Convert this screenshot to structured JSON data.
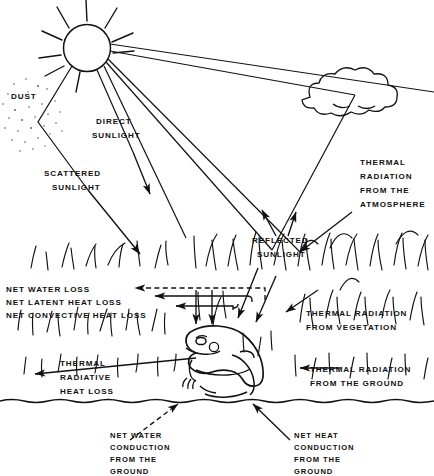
{
  "diagram": {
    "type": "schematic-energy-balance",
    "background_color": "#ffffff",
    "ink_color": "#111111"
  },
  "labels": {
    "dust": "DUST",
    "direct_sunlight": {
      "line1": "DIRECT",
      "line2": "SUNLIGHT"
    },
    "scattered_sunlight": {
      "line1": "SCATTERED",
      "line2": "SUNLIGHT"
    },
    "reflected_sunlight": {
      "line1": "REFLECTED",
      "line2": "SUNLIGHT"
    },
    "thermal_atmosphere": {
      "line1": "THERMAL",
      "line2": "RADIATION",
      "line3": "FROM THE",
      "line4": "ATMOSPHERE"
    },
    "thermal_vegetation": {
      "line1": "THERMAL RADIATION",
      "line2": "FROM VEGETATION"
    },
    "thermal_ground": {
      "line1": "THERMAL RADIATION",
      "line2": "FROM THE GROUND"
    },
    "net_water_loss": "NET WATER LOSS",
    "net_latent_heat_loss": "NET LATENT HEAT LOSS",
    "net_convective_heat_loss": "NET CONVECTIVE HEAT LOSS",
    "thermal_radiative_heat_loss": {
      "line1": "THERMAL",
      "line2": "RADIATIVE",
      "line3": "HEAT LOSS"
    },
    "net_water_conduction": {
      "line1": "NET WATER",
      "line2": "CONDUCTION",
      "line3": "FROM THE",
      "line4": "GROUND"
    },
    "net_heat_conduction": {
      "line1": "NET HEAT",
      "line2": "CONDUCTION",
      "line3": "FROM THE",
      "line4": "GROUND"
    }
  },
  "elements": {
    "sun": "sun-icon",
    "cloud": "cloud-icon",
    "frog": "frog-icon",
    "ground": "ground-line",
    "vegetation": "grass-blades",
    "dust_cloud": "dust-speckles"
  },
  "flows": {
    "incoming": [
      "direct sunlight",
      "scattered sunlight",
      "reflected sunlight",
      "thermal radiation from the atmosphere",
      "thermal radiation from vegetation",
      "thermal radiation from the ground",
      "net water conduction from the ground",
      "net heat conduction from the ground"
    ],
    "outgoing": [
      "net water loss",
      "net latent heat loss",
      "net convective heat loss",
      "thermal radiative heat loss"
    ]
  }
}
